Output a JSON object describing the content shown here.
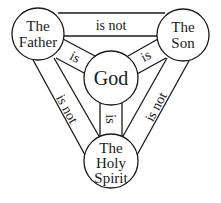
{
  "diagram": {
    "nodes": {
      "father": {
        "lines": [
          "The",
          "Father"
        ]
      },
      "son": {
        "lines": [
          "The",
          "Son"
        ]
      },
      "god": {
        "lines": [
          "God"
        ]
      },
      "spirit": {
        "lines": [
          "The",
          "Holy",
          "Spirit"
        ]
      }
    },
    "edges": {
      "father_son": "is not",
      "father_god": "is",
      "son_god": "is",
      "spirit_god": "is",
      "father_spirit": "is not",
      "son_spirit": "is not"
    },
    "colors": {
      "line": "#1a1a1a",
      "background": "#ffffff"
    }
  }
}
